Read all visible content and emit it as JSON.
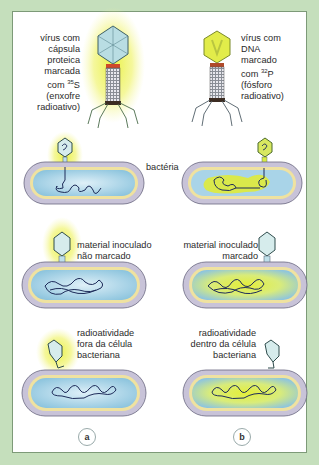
{
  "diagram": {
    "top": {
      "left_virus_label": [
        "vírus com",
        "cápsula",
        "proteica",
        "marcada",
        "com ",
        "(enxofre",
        "radioativo)"
      ],
      "left_isotope": "35",
      "left_isotope_element": "S",
      "right_virus_label": [
        "vírus com",
        "DNA",
        "marcado",
        "com ",
        "(fósforo",
        "radioativo)"
      ],
      "right_isotope": "32",
      "right_isotope_element": "P"
    },
    "row1": {
      "middle_label": "bactéria"
    },
    "row2": {
      "left_label": [
        "material inoculado",
        "não marcado"
      ],
      "right_label": [
        "material inoculado",
        "marcado"
      ]
    },
    "row3": {
      "left_label": [
        "radioatividade",
        "fora da célula",
        "bacteriana"
      ],
      "right_label": [
        "radioatividade",
        "dentro da célula",
        "bacteriana"
      ]
    },
    "columns": [
      "a",
      "b"
    ],
    "colors": {
      "background": "#c5dfbc",
      "panel": "#ffffff",
      "radioactive_glow": "#e8f03a",
      "cytoplasm": "#a9d4e8",
      "cell_wall": "#c8c3d8",
      "membrane": "#efe2a0",
      "dna": "#1e2c5a"
    }
  }
}
